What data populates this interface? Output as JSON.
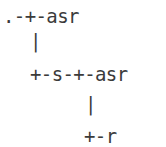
{
  "diagram": {
    "kind": "ascii-tree",
    "text_color": "#3b3b3b",
    "background_color": "#ffffff",
    "lines": [
      {
        "id": "root-branch",
        "text": ".-+-asr"
      },
      {
        "id": "root-connector",
        "text": "|"
      },
      {
        "id": "second-branch",
        "text": "+-s-+-asr"
      },
      {
        "id": "second-connector",
        "text": "|"
      },
      {
        "id": "leaf-branch",
        "text": "+-r"
      }
    ],
    "full_text": ".-+-asr\n  |\n  +-s-+-asr\n      |\n      +-r"
  }
}
